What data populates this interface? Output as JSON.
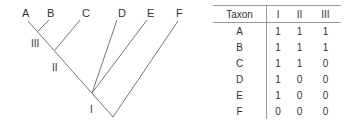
{
  "tree": {
    "taxa": [
      {
        "label": "A",
        "x": 22,
        "y": 8
      },
      {
        "label": "B",
        "x": 47,
        "y": 8
      },
      {
        "label": "C",
        "x": 82,
        "y": 8
      },
      {
        "label": "D",
        "x": 118,
        "y": 8
      },
      {
        "label": "E",
        "x": 147,
        "y": 8
      },
      {
        "label": "F",
        "x": 176,
        "y": 8
      }
    ],
    "node_labels": [
      {
        "label": "III",
        "x": 31,
        "y": 39
      },
      {
        "label": "II",
        "x": 52,
        "y": 63
      },
      {
        "label": "I",
        "x": 90,
        "y": 105
      }
    ],
    "line_color": "#777777"
  },
  "table": {
    "headers": [
      "Taxon",
      "I",
      "II",
      "III"
    ],
    "rows": [
      [
        "A",
        "1",
        "1",
        "1"
      ],
      [
        "B",
        "1",
        "1",
        "1"
      ],
      [
        "C",
        "1",
        "1",
        "0"
      ],
      [
        "D",
        "1",
        "0",
        "0"
      ],
      [
        "E",
        "1",
        "0",
        "0"
      ],
      [
        "F",
        "0",
        "0",
        "0"
      ]
    ]
  }
}
